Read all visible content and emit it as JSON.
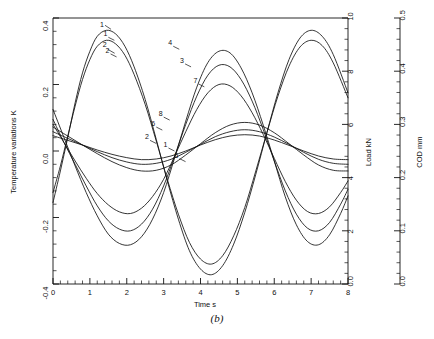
{
  "figure": {
    "caption": "(b)"
  },
  "chart_data": {
    "type": "line",
    "title": "",
    "xlabel": "Time  s",
    "ylabel": "Temperature variations   K",
    "xlim": [
      0,
      8
    ],
    "ylim": [
      -0.4,
      0.4
    ],
    "grid": false,
    "legend": "inline-curve-labels",
    "x_ticks": [
      0,
      1,
      2,
      3,
      4,
      5,
      6,
      7,
      8
    ],
    "x_tick_labels": [
      "0",
      "1",
      "2",
      "3",
      "4",
      "5",
      "6",
      "7",
      "8"
    ],
    "x_minor_per_interval": 5,
    "y_ticks": [
      -0.4,
      -0.2,
      0.0,
      0.2,
      0.4
    ],
    "y_tick_labels": [
      "-0.4",
      "-0.2",
      "0.0",
      "0.2",
      "0.4"
    ],
    "y_minor_per_interval": 4,
    "secondary_axes": [
      {
        "name": "load-axis",
        "label": "Load  kN",
        "lim": [
          0.0,
          10
        ],
        "ticks": [
          0.0,
          2,
          4,
          6,
          8,
          10
        ],
        "tick_labels": [
          "0.0",
          "2",
          "4",
          "6",
          "8",
          "10"
        ],
        "minor_per_interval": 4,
        "position": "right-inner"
      },
      {
        "name": "cod-axis",
        "label": "COD  mm",
        "lim": [
          0.0,
          0.5
        ],
        "ticks": [
          0.0,
          0.1,
          0.2,
          0.3,
          0.4,
          0.5
        ],
        "tick_labels": [
          "0.0",
          "0.1",
          "0.2",
          "0.3",
          "0.4",
          "0.5"
        ],
        "minor_per_interval": 4,
        "position": "right-outer"
      }
    ],
    "period": 5.0,
    "series": [
      {
        "name": "1",
        "label": "1",
        "label_positions": [
          {
            "x": 1.42,
            "y": 0.345
          },
          {
            "x": 3.05,
            "y": 0.012
          }
        ],
        "amplitude": 0.375,
        "offset": 0.0,
        "phase_x0": 0.43,
        "y_at_x0": -0.155,
        "points": [
          {
            "x": 0.0,
            "y": -0.155
          },
          {
            "x": 0.2,
            "y": -0.06
          },
          {
            "x": 0.4,
            "y": 0.04
          },
          {
            "x": 0.6,
            "y": 0.145
          },
          {
            "x": 0.8,
            "y": 0.235
          },
          {
            "x": 1.0,
            "y": 0.3
          },
          {
            "x": 1.2,
            "y": 0.345
          },
          {
            "x": 1.45,
            "y": 0.363
          },
          {
            "x": 1.7,
            "y": 0.352
          },
          {
            "x": 1.95,
            "y": 0.315
          },
          {
            "x": 2.2,
            "y": 0.253
          },
          {
            "x": 2.5,
            "y": 0.155
          },
          {
            "x": 2.8,
            "y": 0.035
          },
          {
            "x": 3.1,
            "y": -0.09
          },
          {
            "x": 3.4,
            "y": -0.205
          },
          {
            "x": 3.7,
            "y": -0.3
          },
          {
            "x": 4.0,
            "y": -0.355
          },
          {
            "x": 4.3,
            "y": -0.372
          },
          {
            "x": 4.6,
            "y": -0.345
          },
          {
            "x": 4.9,
            "y": -0.28
          },
          {
            "x": 5.2,
            "y": -0.185
          },
          {
            "x": 5.5,
            "y": -0.07
          },
          {
            "x": 5.8,
            "y": 0.055
          },
          {
            "x": 6.1,
            "y": 0.175
          },
          {
            "x": 6.4,
            "y": 0.275
          },
          {
            "x": 6.7,
            "y": 0.34
          },
          {
            "x": 7.0,
            "y": 0.363
          },
          {
            "x": 7.3,
            "y": 0.345
          },
          {
            "x": 7.6,
            "y": 0.29
          },
          {
            "x": 8.0,
            "y": 0.175
          }
        ]
      },
      {
        "name": "2",
        "label": "2",
        "label_positions": [
          {
            "x": 1.48,
            "y": 0.295
          },
          {
            "x": 2.55,
            "y": 0.035
          }
        ],
        "amplitude": 0.345,
        "offset": 0.0,
        "phase_x0": 0.45,
        "y_at_x0": -0.125,
        "points": [
          {
            "x": 0.0,
            "y": -0.125
          },
          {
            "x": 0.2,
            "y": -0.045
          },
          {
            "x": 0.4,
            "y": 0.045
          },
          {
            "x": 0.6,
            "y": 0.135
          },
          {
            "x": 0.8,
            "y": 0.215
          },
          {
            "x": 1.0,
            "y": 0.275
          },
          {
            "x": 1.2,
            "y": 0.315
          },
          {
            "x": 1.45,
            "y": 0.333
          },
          {
            "x": 1.7,
            "y": 0.322
          },
          {
            "x": 1.95,
            "y": 0.288
          },
          {
            "x": 2.2,
            "y": 0.23
          },
          {
            "x": 2.5,
            "y": 0.14
          },
          {
            "x": 2.8,
            "y": 0.03
          },
          {
            "x": 3.1,
            "y": -0.085
          },
          {
            "x": 3.4,
            "y": -0.19
          },
          {
            "x": 3.7,
            "y": -0.275
          },
          {
            "x": 4.0,
            "y": -0.325
          },
          {
            "x": 4.3,
            "y": -0.34
          },
          {
            "x": 4.6,
            "y": -0.315
          },
          {
            "x": 4.9,
            "y": -0.255
          },
          {
            "x": 5.2,
            "y": -0.17
          },
          {
            "x": 5.5,
            "y": -0.06
          },
          {
            "x": 5.8,
            "y": 0.055
          },
          {
            "x": 6.1,
            "y": 0.165
          },
          {
            "x": 6.4,
            "y": 0.255
          },
          {
            "x": 6.7,
            "y": 0.313
          },
          {
            "x": 7.0,
            "y": 0.333
          },
          {
            "x": 7.3,
            "y": 0.317
          },
          {
            "x": 7.6,
            "y": 0.265
          },
          {
            "x": 8.0,
            "y": 0.16
          }
        ]
      },
      {
        "name": "3",
        "label": "3",
        "label_positions": [
          {
            "x": 3.5,
            "y": 0.265
          }
        ],
        "amplitude": 0.255,
        "offset": 0.0,
        "phase_x0": 2.85,
        "y_at_x0": -0.105,
        "points": [
          {
            "x": 0.0,
            "y": 0.095
          },
          {
            "x": 0.3,
            "y": 0.025
          },
          {
            "x": 0.6,
            "y": -0.04
          },
          {
            "x": 0.9,
            "y": -0.105
          },
          {
            "x": 1.2,
            "y": -0.165
          },
          {
            "x": 1.5,
            "y": -0.21
          },
          {
            "x": 1.8,
            "y": -0.235
          },
          {
            "x": 2.1,
            "y": -0.24
          },
          {
            "x": 2.4,
            "y": -0.22
          },
          {
            "x": 2.7,
            "y": -0.175
          },
          {
            "x": 3.0,
            "y": -0.105
          },
          {
            "x": 3.3,
            "y": -0.015
          },
          {
            "x": 3.6,
            "y": 0.08
          },
          {
            "x": 3.9,
            "y": 0.165
          },
          {
            "x": 4.2,
            "y": 0.228
          },
          {
            "x": 4.5,
            "y": 0.258
          },
          {
            "x": 4.8,
            "y": 0.253
          },
          {
            "x": 5.1,
            "y": 0.215
          },
          {
            "x": 5.4,
            "y": 0.15
          },
          {
            "x": 5.7,
            "y": 0.065
          },
          {
            "x": 6.0,
            "y": -0.03
          },
          {
            "x": 6.3,
            "y": -0.12
          },
          {
            "x": 6.6,
            "y": -0.19
          },
          {
            "x": 6.9,
            "y": -0.232
          },
          {
            "x": 7.2,
            "y": -0.24
          },
          {
            "x": 7.5,
            "y": -0.215
          },
          {
            "x": 7.8,
            "y": -0.16
          },
          {
            "x": 8.0,
            "y": -0.115
          }
        ]
      },
      {
        "name": "4",
        "label": "4",
        "label_positions": [
          {
            "x": 3.18,
            "y": 0.318
          }
        ],
        "amplitude": 0.3,
        "offset": 0.0,
        "phase_x0": 2.8,
        "y_at_x0": -0.125,
        "points": [
          {
            "x": 0.0,
            "y": 0.125
          },
          {
            "x": 0.3,
            "y": 0.04
          },
          {
            "x": 0.6,
            "y": -0.045
          },
          {
            "x": 0.9,
            "y": -0.125
          },
          {
            "x": 1.2,
            "y": -0.195
          },
          {
            "x": 1.5,
            "y": -0.25
          },
          {
            "x": 1.8,
            "y": -0.278
          },
          {
            "x": 2.1,
            "y": -0.282
          },
          {
            "x": 2.4,
            "y": -0.258
          },
          {
            "x": 2.7,
            "y": -0.205
          },
          {
            "x": 3.0,
            "y": -0.125
          },
          {
            "x": 3.3,
            "y": -0.02
          },
          {
            "x": 3.6,
            "y": 0.09
          },
          {
            "x": 3.9,
            "y": 0.192
          },
          {
            "x": 4.2,
            "y": 0.266
          },
          {
            "x": 4.5,
            "y": 0.3
          },
          {
            "x": 4.8,
            "y": 0.295
          },
          {
            "x": 5.1,
            "y": 0.25
          },
          {
            "x": 5.4,
            "y": 0.175
          },
          {
            "x": 5.7,
            "y": 0.078
          },
          {
            "x": 6.0,
            "y": -0.03
          },
          {
            "x": 6.3,
            "y": -0.138
          },
          {
            "x": 6.6,
            "y": -0.222
          },
          {
            "x": 6.9,
            "y": -0.272
          },
          {
            "x": 7.2,
            "y": -0.282
          },
          {
            "x": 7.5,
            "y": -0.252
          },
          {
            "x": 7.8,
            "y": -0.188
          },
          {
            "x": 8.0,
            "y": -0.135
          }
        ]
      },
      {
        "name": "5",
        "label": "5",
        "label_positions": [
          {
            "x": 3.35,
            "y": -0.02
          }
        ],
        "amplitude": 0.082,
        "offset": 0.012,
        "phase_x0": 0.4,
        "y_at_x0": 0.072,
        "points": [
          {
            "x": 0.0,
            "y": 0.072
          },
          {
            "x": 0.4,
            "y": 0.045
          },
          {
            "x": 0.8,
            "y": 0.018
          },
          {
            "x": 1.2,
            "y": -0.008
          },
          {
            "x": 1.6,
            "y": -0.032
          },
          {
            "x": 2.0,
            "y": -0.05
          },
          {
            "x": 2.4,
            "y": -0.06
          },
          {
            "x": 2.8,
            "y": -0.058
          },
          {
            "x": 3.2,
            "y": -0.042
          },
          {
            "x": 3.6,
            "y": -0.012
          },
          {
            "x": 4.0,
            "y": 0.022
          },
          {
            "x": 4.4,
            "y": 0.055
          },
          {
            "x": 4.8,
            "y": 0.078
          },
          {
            "x": 5.2,
            "y": 0.086
          },
          {
            "x": 5.6,
            "y": 0.078
          },
          {
            "x": 6.0,
            "y": 0.055
          },
          {
            "x": 6.4,
            "y": 0.022
          },
          {
            "x": 6.8,
            "y": -0.012
          },
          {
            "x": 7.2,
            "y": -0.042
          },
          {
            "x": 7.6,
            "y": -0.058
          },
          {
            "x": 8.0,
            "y": -0.06
          }
        ]
      },
      {
        "name": "6",
        "label": "6",
        "label_positions": [
          {
            "x": 2.72,
            "y": 0.075
          }
        ],
        "amplitude": 0.062,
        "offset": 0.008,
        "phase_x0": 0.38,
        "y_at_x0": 0.058,
        "points": [
          {
            "x": 0.0,
            "y": 0.058
          },
          {
            "x": 0.4,
            "y": 0.038
          },
          {
            "x": 0.8,
            "y": 0.018
          },
          {
            "x": 1.2,
            "y": -0.002
          },
          {
            "x": 1.6,
            "y": -0.02
          },
          {
            "x": 2.0,
            "y": -0.033
          },
          {
            "x": 2.4,
            "y": -0.04
          },
          {
            "x": 2.8,
            "y": -0.037
          },
          {
            "x": 3.2,
            "y": -0.025
          },
          {
            "x": 3.6,
            "y": -0.004
          },
          {
            "x": 4.0,
            "y": 0.02
          },
          {
            "x": 4.4,
            "y": 0.043
          },
          {
            "x": 4.8,
            "y": 0.058
          },
          {
            "x": 5.2,
            "y": 0.064
          },
          {
            "x": 5.6,
            "y": 0.058
          },
          {
            "x": 6.0,
            "y": 0.042
          },
          {
            "x": 6.4,
            "y": 0.02
          },
          {
            "x": 6.8,
            "y": -0.004
          },
          {
            "x": 7.2,
            "y": -0.025
          },
          {
            "x": 7.6,
            "y": -0.037
          },
          {
            "x": 8.0,
            "y": -0.04
          }
        ]
      },
      {
        "name": "7",
        "label": "7",
        "label_positions": [
          {
            "x": 3.86,
            "y": 0.205
          }
        ],
        "amplitude": 0.2,
        "offset": 0.0,
        "phase_x0": 2.9,
        "y_at_x0": -0.082,
        "points": [
          {
            "x": 0.0,
            "y": 0.08
          },
          {
            "x": 0.3,
            "y": 0.025
          },
          {
            "x": 0.6,
            "y": -0.03
          },
          {
            "x": 0.9,
            "y": -0.082
          },
          {
            "x": 1.2,
            "y": -0.128
          },
          {
            "x": 1.5,
            "y": -0.162
          },
          {
            "x": 1.8,
            "y": -0.183
          },
          {
            "x": 2.1,
            "y": -0.188
          },
          {
            "x": 2.4,
            "y": -0.172
          },
          {
            "x": 2.7,
            "y": -0.137
          },
          {
            "x": 3.0,
            "y": -0.085
          },
          {
            "x": 3.3,
            "y": -0.015
          },
          {
            "x": 3.6,
            "y": 0.058
          },
          {
            "x": 3.9,
            "y": 0.125
          },
          {
            "x": 4.2,
            "y": 0.175
          },
          {
            "x": 4.5,
            "y": 0.2
          },
          {
            "x": 4.8,
            "y": 0.196
          },
          {
            "x": 5.1,
            "y": 0.166
          },
          {
            "x": 5.4,
            "y": 0.115
          },
          {
            "x": 5.7,
            "y": 0.05
          },
          {
            "x": 6.0,
            "y": -0.022
          },
          {
            "x": 6.3,
            "y": -0.092
          },
          {
            "x": 6.6,
            "y": -0.148
          },
          {
            "x": 6.9,
            "y": -0.182
          },
          {
            "x": 7.2,
            "y": -0.188
          },
          {
            "x": 7.5,
            "y": -0.168
          },
          {
            "x": 7.8,
            "y": -0.125
          },
          {
            "x": 8.0,
            "y": -0.09
          }
        ]
      },
      {
        "name": "8",
        "label": "8",
        "label_positions": [
          {
            "x": 2.92,
            "y": 0.105
          }
        ],
        "amplitude": 0.045,
        "offset": 0.006,
        "phase_x0": 0.36,
        "y_at_x0": 0.046,
        "points": [
          {
            "x": 0.0,
            "y": 0.046
          },
          {
            "x": 0.4,
            "y": 0.032
          },
          {
            "x": 0.8,
            "y": 0.018
          },
          {
            "x": 1.2,
            "y": 0.003
          },
          {
            "x": 1.6,
            "y": -0.01
          },
          {
            "x": 2.0,
            "y": -0.02
          },
          {
            "x": 2.4,
            "y": -0.026
          },
          {
            "x": 2.8,
            "y": -0.024
          },
          {
            "x": 3.2,
            "y": -0.015
          },
          {
            "x": 3.6,
            "y": 0.0
          },
          {
            "x": 4.0,
            "y": 0.018
          },
          {
            "x": 4.4,
            "y": 0.034
          },
          {
            "x": 4.8,
            "y": 0.045
          },
          {
            "x": 5.2,
            "y": 0.049
          },
          {
            "x": 5.6,
            "y": 0.045
          },
          {
            "x": 6.0,
            "y": 0.033
          },
          {
            "x": 6.4,
            "y": 0.017
          },
          {
            "x": 6.8,
            "y": 0.0
          },
          {
            "x": 7.2,
            "y": -0.015
          },
          {
            "x": 7.6,
            "y": -0.024
          },
          {
            "x": 8.0,
            "y": -0.026
          }
        ]
      }
    ],
    "top_labels": [
      {
        "text": "1",
        "x": 1.33,
        "y": 0.372
      },
      {
        "text": "2",
        "x": 1.4,
        "y": 0.312
      }
    ]
  }
}
